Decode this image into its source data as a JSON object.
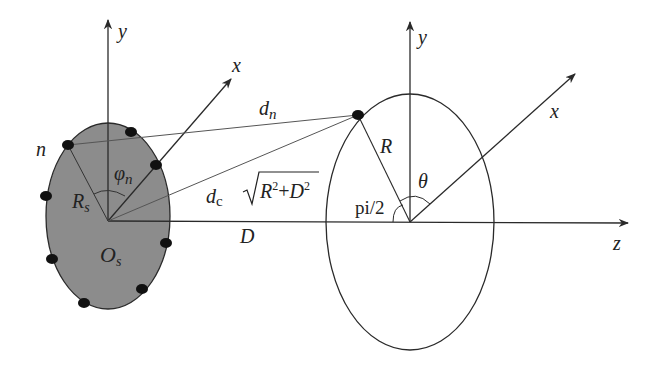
{
  "diagram": {
    "title": "",
    "colors": {
      "background": "#ffffff",
      "stroke": "#2a2a2a",
      "thin_line": "#555555",
      "source_fill": "#8c8c8c",
      "dot": "#111111"
    },
    "source_array": {
      "labels": {
        "y_axis": "y",
        "x_axis": "x",
        "element": "n",
        "angle": "φ",
        "angle_sub": "n",
        "radius": "R",
        "radius_sub": "s",
        "origin": "O",
        "origin_sub": "s"
      },
      "element_count": 8
    },
    "links": {
      "dn": "d",
      "dn_sub": "n",
      "dc": "d",
      "dc_sub": "c",
      "dc_formula": "R²+D²",
      "dc_formula_R": "R",
      "dc_formula_D": "D",
      "sup": "2",
      "plus": "+",
      "distance": "D"
    },
    "receiver": {
      "labels": {
        "y_axis": "y",
        "x_axis": "x",
        "z_axis": "z",
        "radius": "R",
        "angle": "θ",
        "right_angle": "pi/2"
      }
    }
  }
}
